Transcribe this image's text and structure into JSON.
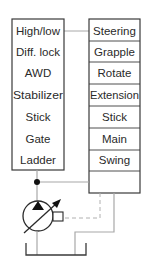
{
  "diagram": {
    "type": "hydraulic-schematic",
    "left_block": {
      "name": "valve-block-left",
      "items": [
        "High/low",
        "Diff. lock",
        "AWD",
        "Stabilizer",
        "Stick",
        "Gate",
        "Ladder"
      ]
    },
    "right_block": {
      "name": "valve-block-right",
      "items": [
        "Steering",
        "Grapple",
        "Rotate",
        "Extension",
        "Stick",
        "Main",
        "Swing",
        ""
      ]
    },
    "components": {
      "pump": "variable-displacement-pump",
      "tank": "reservoir",
      "junction": "junction-dot"
    },
    "colors": {
      "box_stroke": "#3a3a3a",
      "line": "#a8a8a8",
      "text": "#2a2a2a",
      "background": "#ffffff"
    }
  }
}
